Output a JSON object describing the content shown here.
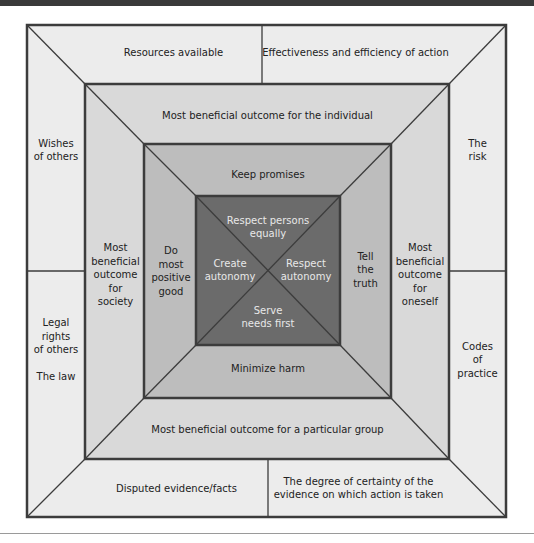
{
  "colors": {
    "topbar": "#3a3a3a",
    "band1": "#ececec",
    "band2": "#d9d9d9",
    "band3": "#bdbdbd",
    "core": "#6b6b6b",
    "border": "#3c3c3c",
    "core_text": "#e8e8e8"
  },
  "outer_band": {
    "top_left": "Resources available",
    "top_right": "Effectiveness and efficiency of action",
    "left_top": "Wishes\nof others",
    "left_bottom": "Legal\nrights\nof others\n\nThe law",
    "right_top": "The\nrisk",
    "right_bottom": "Codes\nof\npractice",
    "bottom_left": "Disputed evidence/facts",
    "bottom_right": "The degree of certainty of the\nevidence on which action is taken"
  },
  "second_band": {
    "top": "Most beneficial outcome for the individual",
    "left": "Most\nbeneficial\noutcome\nfor\nsociety",
    "right": "Most\nbeneficial\noutcome\nfor\noneself",
    "bottom": "Most beneficial outcome for a particular group"
  },
  "third_band": {
    "top": "Keep promises",
    "left": "Do\nmost\npositive\ngood",
    "right": "Tell\nthe\ntruth",
    "bottom": "Minimize harm"
  },
  "core": {
    "top": "Respect persons\nequally",
    "left": "Create\nautonomy",
    "right": "Respect\nautonomy",
    "bottom": "Serve\nneeds first"
  }
}
